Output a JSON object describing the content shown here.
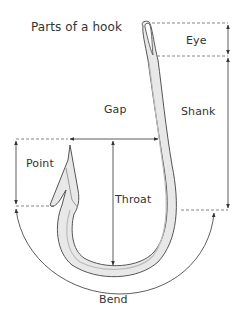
{
  "title": "Parts of a hook",
  "labels": {
    "eye": "Eye",
    "gap": "Gap",
    "shank": "Shank",
    "point": "Point",
    "throat": "Throat",
    "bend": "Bend"
  },
  "colors": {
    "line": "#333333",
    "hook_outline": "#555555",
    "hook_fill": "#e6e6e6",
    "dashed": "#666666",
    "background": "#ffffff"
  }
}
